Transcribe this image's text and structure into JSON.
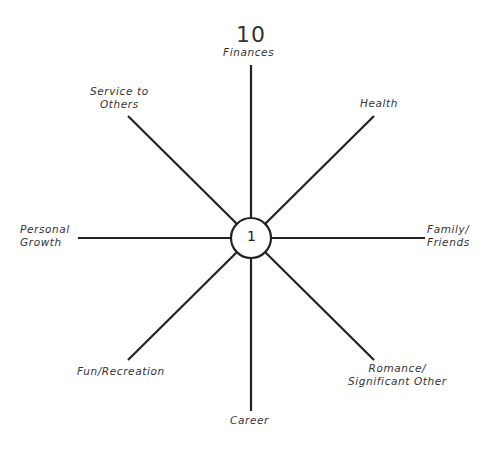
{
  "diagram": {
    "type": "wheel-of-life",
    "scale": {
      "max_label": "10",
      "center_label": "1"
    },
    "center": {
      "x": 251,
      "y": 238,
      "radius": 20
    },
    "line_color": "#222222",
    "spokes": [
      {
        "label_lines": [
          "Finances"
        ],
        "angle": 0
      },
      {
        "label_lines": [
          "Health"
        ],
        "angle": 45
      },
      {
        "label_lines": [
          "Family/",
          "Friends"
        ],
        "angle": 90
      },
      {
        "label_lines": [
          "Romance/",
          "Significant Other"
        ],
        "angle": 135
      },
      {
        "label_lines": [
          "Career"
        ],
        "angle": 180
      },
      {
        "label_lines": [
          "Fun/Recreation"
        ],
        "angle": 225
      },
      {
        "label_lines": [
          "Personal",
          "Growth"
        ],
        "angle": 270
      },
      {
        "label_lines": [
          "Service to",
          "Others"
        ],
        "angle": 315
      }
    ]
  }
}
